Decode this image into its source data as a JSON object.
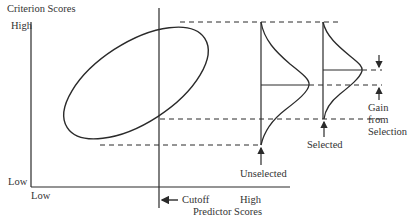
{
  "diagram": {
    "y_axis": {
      "title": "Criterion Scores",
      "high_label": "High",
      "low_label": "Low"
    },
    "x_axis": {
      "title": "Predictor Scores",
      "low_label": "Low",
      "high_label": "High"
    },
    "cutoff_label": "Cutoff",
    "distributions": {
      "unselected_label": "Unselected",
      "selected_label": "Selected"
    },
    "gain_label": [
      "Gain",
      "from",
      "Selection"
    ],
    "colors": {
      "ink": "#2a2a2a",
      "background": "#ffffff"
    }
  }
}
